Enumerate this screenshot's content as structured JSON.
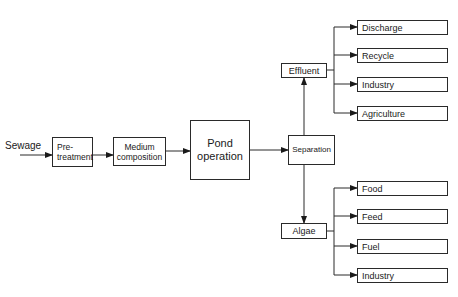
{
  "diagram": {
    "input_label": "Sewage",
    "nodes": {
      "pretreatment": "Pre-\ntreatment",
      "medium": "Medium composition",
      "pond": "Pond operation",
      "separation": "Separation",
      "effluent": "Effluent",
      "algae": "Algae"
    },
    "effluent_outputs": [
      "Discharge",
      "Recycle",
      "Industry",
      "Agriculture"
    ],
    "algae_outputs": [
      "Food",
      "Feed",
      "Fuel",
      "Industry"
    ],
    "line_color": "#2a2a2a"
  }
}
